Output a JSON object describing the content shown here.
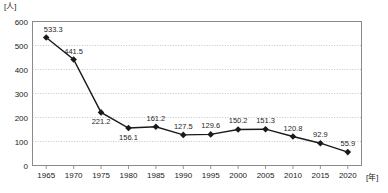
{
  "chart_data": {
    "type": "line",
    "title": "",
    "subtitle": "",
    "xlabel": "[年]",
    "ylabel": "[人]",
    "y_unit": "[人]",
    "x_unit": "[年]",
    "categories": [
      "1965",
      "1970",
      "1975",
      "1980",
      "1985",
      "1990",
      "1995",
      "2000",
      "2005",
      "2010",
      "2015",
      "2020"
    ],
    "values": [
      533.3,
      441.5,
      221.2,
      156.1,
      161.2,
      127.5,
      129.6,
      150.2,
      151.3,
      120.8,
      92.9,
      55.9
    ],
    "point_labels": [
      "533.3",
      "441.5",
      "221.2",
      "156.1",
      "161.2",
      "127.5",
      "129.6",
      "150.2",
      "151.3",
      "120.8",
      "92.9",
      "55.9"
    ],
    "label_positions": [
      "above",
      "above",
      "below",
      "below",
      "above",
      "above",
      "above",
      "above",
      "above",
      "above",
      "above",
      "above"
    ],
    "ylim": [
      0,
      600
    ],
    "ytick_labels": [
      "0",
      "100",
      "200",
      "300",
      "400",
      "500",
      "600"
    ],
    "ytick_values": [
      0,
      100,
      200,
      300,
      400,
      500,
      600
    ],
    "grid": true,
    "grid_style": "dotted-horizontal",
    "legend": null,
    "legend_position": "none",
    "series_color": "#1a1a1a",
    "marker": "diamond",
    "marker_color": "#1a1a1a",
    "grid_color": "#b4b4b4",
    "axis_color": "#8a8a8a",
    "background": "#ffffff"
  }
}
